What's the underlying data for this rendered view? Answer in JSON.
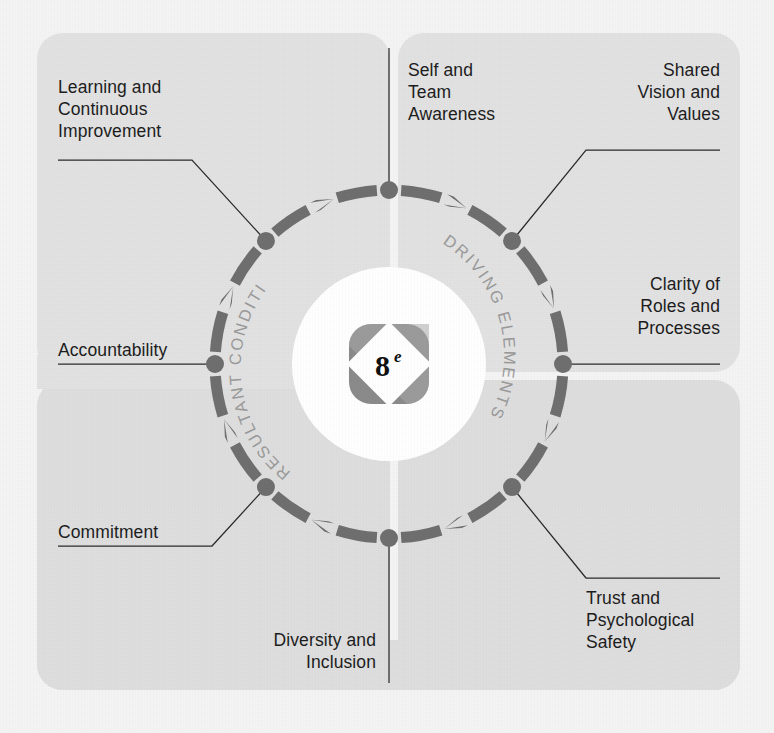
{
  "diagram": {
    "center_logo": {
      "number": "8",
      "suffix": "e"
    },
    "arc_labels": {
      "driving": "DRIVING ELEMENTS",
      "resultant": "RESULTANT CONDITIONS"
    },
    "colors": {
      "background": "#f4f4f4",
      "panel": "#e2e2e2",
      "panel_alt": "#dedede",
      "ring": "#6f6f6f",
      "node": "#6f6f6f",
      "leader": "#2b2b2b",
      "label_text": "#1d1d1d",
      "arc_text": "#9a9a9a",
      "inner_disc": "#ffffff"
    },
    "nodes": [
      {
        "id": "self-and-team-awareness",
        "group": "driving",
        "angle_deg": 270,
        "label_lines": [
          "Self and",
          "Team",
          "Awareness"
        ]
      },
      {
        "id": "shared-vision-and-values",
        "group": "driving",
        "angle_deg": 315,
        "label_lines": [
          "Shared",
          "Vision and",
          "Values"
        ]
      },
      {
        "id": "clarity-of-roles-and-processes",
        "group": "driving",
        "angle_deg": 0,
        "label_lines": [
          "Clarity of",
          "Roles and",
          "Processes"
        ]
      },
      {
        "id": "trust-and-psychological-safety",
        "group": "driving",
        "angle_deg": 45,
        "label_lines": [
          "Trust and",
          "Psychological",
          "Safety"
        ]
      },
      {
        "id": "diversity-and-inclusion",
        "group": "resultant",
        "angle_deg": 90,
        "label_lines": [
          "Diversity and",
          "Inclusion"
        ]
      },
      {
        "id": "commitment",
        "group": "resultant",
        "angle_deg": 135,
        "label_lines": [
          "Commitment"
        ]
      },
      {
        "id": "accountability",
        "group": "resultant",
        "angle_deg": 180,
        "label_lines": [
          "Accountability"
        ]
      },
      {
        "id": "learning-and-continuous-improvement",
        "group": "resultant",
        "angle_deg": 225,
        "label_lines": [
          "Learning and",
          "Continuous",
          "Improvement"
        ]
      }
    ],
    "geometry": {
      "center_x": 389,
      "center_y": 364,
      "ring_radius": 174,
      "node_radius": 9,
      "inner_disc_radius": 97
    }
  }
}
